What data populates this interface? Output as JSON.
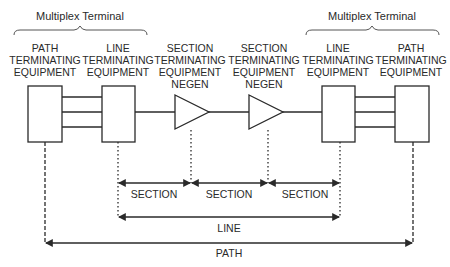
{
  "diagram": {
    "title_left": "Multiplex Terminal",
    "title_right": "Multiplex Terminal",
    "equipment": {
      "left_pte": [
        "PATH",
        "TERMINATING",
        "EQUIPMENT"
      ],
      "left_lte": [
        "LINE",
        "TERMINATING",
        "EQUIPMENT"
      ],
      "regen_1": [
        "SECTION",
        "TERMINATING",
        "EQUIPMENT",
        "NEGEN"
      ],
      "regen_2": [
        "SECTION",
        "TERMINATING",
        "EQUIPMENT",
        "NEGEN"
      ],
      "right_lte": [
        "LINE",
        "TERMINATING",
        "EQUIPMENT"
      ],
      "right_pte": [
        "PATH",
        "TERMINATING",
        "EQUIPMENT"
      ]
    },
    "spans": {
      "section_1": "SECTION",
      "section_2": "SECTION",
      "section_3": "SECTION",
      "line": "LINE",
      "path": "PATH"
    },
    "colors": {
      "stroke": "#2a2a2a",
      "background": "#ffffff",
      "brace": "#555555"
    }
  }
}
